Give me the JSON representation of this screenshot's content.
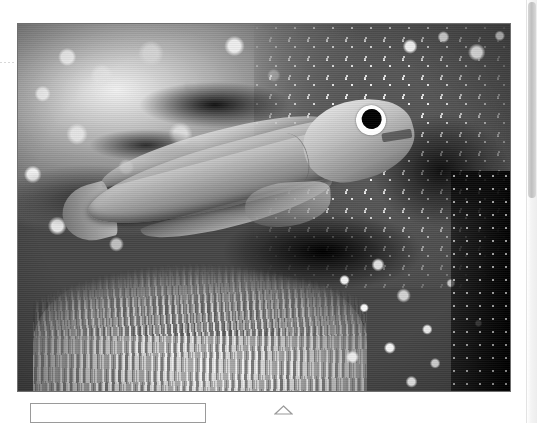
{
  "page": {
    "background_color": "#ffffff"
  },
  "photo": {
    "alt_description": "Underwater grayscale photograph of a slender fish hovering above a sea anemone on a coral reef",
    "subjects": [
      "fish",
      "sea-anemone",
      "coral-rubble",
      "speckled-coral",
      "dark-crevice"
    ],
    "is_grayscale": true,
    "border_color": "#6f6f6f",
    "frame": {
      "left": 17,
      "top": 23,
      "width": 494,
      "height": 369
    }
  },
  "caption_box": {
    "value": "",
    "placeholder": ""
  },
  "triangle_marker": {
    "icon": "triangle-up-icon",
    "stroke_color": "#9a9a9a"
  },
  "left_guide": {
    "style": "dashed",
    "color": "#d8d8d8"
  },
  "scrollbar": {
    "orientation": "vertical",
    "track_color": "#f1f1f1",
    "thumb_color": "#c4c4c4"
  }
}
